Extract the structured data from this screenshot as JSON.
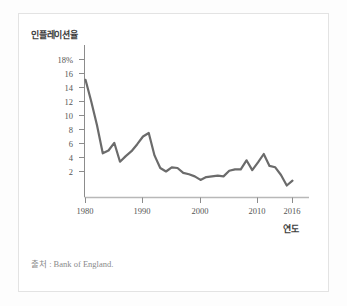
{
  "figure": {
    "source_note": "출처 : Bank of England."
  },
  "chart_data": {
    "type": "line",
    "title": "",
    "subtitle": "",
    "xlabel": "연도",
    "ylabel": "인플레이션율",
    "xlim": [
      1980,
      2016
    ],
    "ylim": [
      0,
      18
    ],
    "grid": false,
    "legend": null,
    "legend_position": "none",
    "line_color": "#6b6b6b",
    "line_width": 2.2,
    "y_ticks": [
      2,
      4,
      6,
      8,
      10,
      12,
      14,
      16,
      18
    ],
    "y_tick_labels": [
      "2",
      "4",
      "6",
      "8",
      "10",
      "12",
      "14",
      "16",
      "18%"
    ],
    "x_ticks": [
      1980,
      1990,
      2000,
      2010,
      2016
    ],
    "x_tick_labels": [
      "1980",
      "1990",
      "2000",
      "2010",
      "2016"
    ],
    "series": [
      {
        "name": "인플레이션율",
        "x": [
          1980,
          1981,
          1982,
          1983,
          1984,
          1985,
          1986,
          1987,
          1988,
          1989,
          1990,
          1991,
          1992,
          1993,
          1994,
          1995,
          1996,
          1997,
          1998,
          1999,
          2000,
          2001,
          2002,
          2003,
          2004,
          2005,
          2006,
          2007,
          2008,
          2009,
          2010,
          2011,
          2012,
          2013,
          2014,
          2015,
          2016
        ],
        "values": [
          15.1,
          12.0,
          8.6,
          4.6,
          5.0,
          6.1,
          3.4,
          4.2,
          4.9,
          5.9,
          7.0,
          7.5,
          4.3,
          2.5,
          2.0,
          2.6,
          2.5,
          1.8,
          1.6,
          1.3,
          0.8,
          1.2,
          1.3,
          1.4,
          1.3,
          2.1,
          2.3,
          2.3,
          3.6,
          2.2,
          3.3,
          4.5,
          2.8,
          2.6,
          1.5,
          0.0,
          0.7
        ]
      }
    ]
  },
  "axes": {
    "y_title": "인플레이션율",
    "x_title": "연도"
  }
}
